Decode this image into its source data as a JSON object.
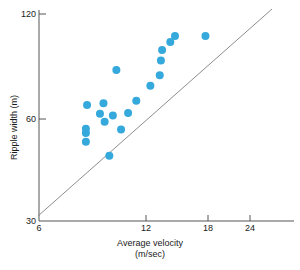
{
  "chart_data": {
    "type": "scatter",
    "title": "",
    "xlabel": "Average velocity (m/sec)",
    "xlabel_line1": "Average velocity",
    "xlabel_line2": "(m/sec)",
    "ylabel": "Ripple width (m)",
    "xlim": [
      6,
      27
    ],
    "ylim": [
      30,
      120
    ],
    "xticks": [
      6,
      12,
      18,
      24
    ],
    "xtick_labels": [
      "6",
      "12",
      "18",
      "24"
    ],
    "yticks": [
      30,
      60,
      120
    ],
    "ytick_labels": [
      "30",
      "60",
      "120"
    ],
    "grid": false,
    "legend": null,
    "marker_color": "#36a9dc",
    "marker_size": 5,
    "line_color": "#808080",
    "axis_color": "#555555",
    "series": [
      {
        "name": "Ripple width vs average velocity",
        "points": [
          {
            "x": 10.0,
            "y": 47.0
          },
          {
            "x": 10.0,
            "y": 52.0
          },
          {
            "x": 10.0,
            "y": 54.5
          },
          {
            "x": 10.1,
            "y": 68.0
          },
          {
            "x": 11.2,
            "y": 63.0
          },
          {
            "x": 11.5,
            "y": 69.0
          },
          {
            "x": 11.6,
            "y": 58.5
          },
          {
            "x": 12.0,
            "y": 39.0
          },
          {
            "x": 12.3,
            "y": 62.0
          },
          {
            "x": 12.6,
            "y": 88.0
          },
          {
            "x": 13.0,
            "y": 54.0
          },
          {
            "x": 13.6,
            "y": 63.5
          },
          {
            "x": 14.3,
            "y": 70.5
          },
          {
            "x": 15.5,
            "y": 79.0
          },
          {
            "x": 16.3,
            "y": 85.0
          },
          {
            "x": 16.4,
            "y": 93.5
          },
          {
            "x": 16.5,
            "y": 99.5
          },
          {
            "x": 17.2,
            "y": 104.0
          },
          {
            "x": 17.6,
            "y": 107.5
          },
          {
            "x": 20.2,
            "y": 107.5
          }
        ]
      }
    ],
    "trend_line": {
      "name": "fitted regression line",
      "x_start": 6.1,
      "y_start": 33.5,
      "x_end": 28.6,
      "y_end": 122.5
    }
  }
}
